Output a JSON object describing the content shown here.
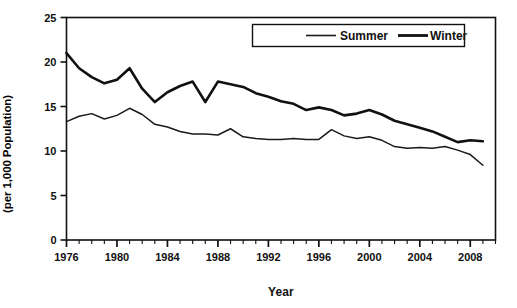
{
  "chart_data": {
    "type": "line",
    "title": "",
    "xlabel": "Year",
    "ylabel": "Standardized Mortality Rate (per 1,000 Population)",
    "ylabel_line1": "Standardized Mortality Rate",
    "ylabel_line2": "(per 1,000 Population)",
    "xlim": [
      1976,
      2010
    ],
    "ylim": [
      0,
      25
    ],
    "ytick_values": [
      0,
      5,
      10,
      15,
      20,
      25
    ],
    "ytick_labels": [
      "0",
      "5",
      "10",
      "15",
      "20",
      "25"
    ],
    "xtick_major_values": [
      1976,
      1980,
      1984,
      1988,
      1992,
      1996,
      2000,
      2004,
      2008
    ],
    "xtick_major_labels": [
      "1976",
      "1980",
      "1984",
      "1988",
      "1992",
      "1996",
      "2000",
      "2004",
      "2008"
    ],
    "xtick_minor_step": 1,
    "grid": false,
    "legend_position": "top-right",
    "x": [
      1976,
      1977,
      1978,
      1979,
      1980,
      1981,
      1982,
      1983,
      1984,
      1985,
      1986,
      1987,
      1988,
      1989,
      1990,
      1991,
      1992,
      1993,
      1994,
      1995,
      1996,
      1997,
      1998,
      1999,
      2000,
      2001,
      2002,
      2003,
      2004,
      2005,
      2006,
      2007,
      2008,
      2009
    ],
    "series": [
      {
        "name": "Summer",
        "color": "#1a1a1a",
        "line_width": 1.5,
        "values": [
          13.3,
          13.9,
          14.2,
          13.6,
          14.0,
          14.8,
          14.1,
          13.0,
          12.7,
          12.2,
          11.9,
          11.9,
          11.8,
          12.5,
          11.6,
          11.4,
          11.3,
          11.3,
          11.4,
          11.3,
          11.3,
          12.4,
          11.7,
          11.4,
          11.6,
          11.2,
          10.5,
          10.3,
          10.4,
          10.3,
          10.5,
          10.1,
          9.6,
          8.4
        ]
      },
      {
        "name": "Winter",
        "color": "#111111",
        "line_width": 2.6,
        "values": [
          21.0,
          19.3,
          18.3,
          17.6,
          18.0,
          19.3,
          17.0,
          15.5,
          16.6,
          17.3,
          17.8,
          15.5,
          17.8,
          17.5,
          17.2,
          16.5,
          16.1,
          15.6,
          15.3,
          14.6,
          14.9,
          14.6,
          14.0,
          14.2,
          14.6,
          14.1,
          13.4,
          13.0,
          12.6,
          12.2,
          11.6,
          11.0,
          11.2,
          11.1
        ]
      }
    ],
    "legend": [
      {
        "label": "Summer",
        "swatch": "thin-line-swatch"
      },
      {
        "label": "Winter",
        "swatch": "thick-line-swatch"
      }
    ]
  }
}
